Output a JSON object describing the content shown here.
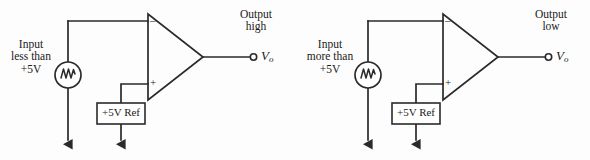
{
  "diagram": {
    "stroke_color": "#2a2a2a",
    "background_color": "#fdfdfd",
    "circuits": [
      {
        "id": "left",
        "input_label_lines": [
          "Input",
          "less than",
          "+5V"
        ],
        "output_label_lines": [
          "Output",
          "high"
        ],
        "output_terminal_name": "Vo",
        "output_terminal_symbol": "V",
        "output_terminal_subscript": "o",
        "reference_box_label": "+5V Ref",
        "opamp_inverting_sign": "–",
        "opamp_noninverting_sign": "+",
        "source_icon": "ac-source-icon",
        "ground_icon": "ground-arrow-icon"
      },
      {
        "id": "right",
        "input_label_lines": [
          "Input",
          "more than",
          "+5V"
        ],
        "output_label_lines": [
          "Output",
          "low"
        ],
        "output_terminal_name": "Vo",
        "output_terminal_symbol": "V",
        "output_terminal_subscript": "o",
        "reference_box_label": "+5V Ref",
        "opamp_inverting_sign": "–",
        "opamp_noninverting_sign": "+",
        "source_icon": "ac-source-icon",
        "ground_icon": "ground-arrow-icon"
      }
    ]
  }
}
